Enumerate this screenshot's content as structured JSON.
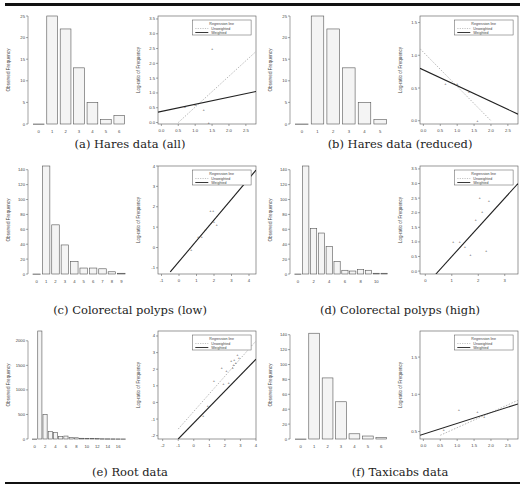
{
  "figure": {
    "subfigures": [
      {
        "id": "a",
        "caption": "(a) Hares data (all)"
      },
      {
        "id": "b",
        "caption": "(b) Hares data (reduced)"
      },
      {
        "id": "c",
        "caption": "(c) Colorectal polyps (low)"
      },
      {
        "id": "d",
        "caption": "(d) Colorectal polyps (high)"
      },
      {
        "id": "e",
        "caption": "(e) Root data"
      },
      {
        "id": "f",
        "caption": "(f) Taxicabs data"
      }
    ]
  },
  "chart_data": [
    {
      "id": "a-bar",
      "type": "bar",
      "ylabel": "Observed Frequency",
      "xlabel": "",
      "categories": [
        "0",
        "1",
        "2",
        "3",
        "4",
        "5",
        "6"
      ],
      "values": [
        0,
        25,
        22,
        13,
        5,
        1,
        2
      ],
      "ylim": [
        0,
        25
      ],
      "yticks": [
        0,
        5,
        10,
        15,
        20,
        25
      ]
    },
    {
      "id": "a-scatter",
      "type": "scatter",
      "ylabel": "Log-ratio of Frequency",
      "xlabel": "",
      "xlim": [
        -0.1,
        2.8
      ],
      "ylim": [
        -0.05,
        3.6
      ],
      "xticks": [
        0.0,
        0.5,
        1.0,
        1.5,
        2.0,
        2.5
      ],
      "yticks": [
        0.0,
        0.5,
        1.0,
        1.5,
        2.0,
        2.5,
        3.0,
        3.5
      ],
      "points": [
        [
          0.7,
          0.55
        ],
        [
          1.0,
          0.6
        ],
        [
          1.25,
          0.45
        ],
        [
          1.4,
          0.0
        ],
        [
          1.5,
          2.5
        ]
      ],
      "lines": {
        "unweighted": [
          [
            0.5,
            0.0
          ],
          [
            2.8,
            2.4
          ]
        ],
        "weighted": [
          [
            -0.1,
            0.35
          ],
          [
            2.8,
            1.05
          ]
        ]
      },
      "legend": {
        "title": "Regression line",
        "entries": [
          "Unweighted",
          "Weighted"
        ]
      }
    },
    {
      "id": "b-bar",
      "type": "bar",
      "ylabel": "Observed Frequency",
      "xlabel": "",
      "categories": [
        "0",
        "1",
        "2",
        "3",
        "4",
        "5"
      ],
      "values": [
        0,
        25,
        22,
        13,
        5,
        1
      ],
      "ylim": [
        0,
        25
      ],
      "yticks": [
        0,
        5,
        10,
        15,
        20,
        25
      ]
    },
    {
      "id": "b-scatter",
      "type": "scatter",
      "ylabel": "Log-ratio of Frequency",
      "xlabel": "",
      "xlim": [
        -0.1,
        2.8
      ],
      "ylim": [
        -0.05,
        1.6
      ],
      "xticks": [
        0.0,
        0.5,
        1.0,
        1.5,
        2.0,
        2.5
      ],
      "yticks": [
        0.0,
        0.5,
        1.0,
        1.5
      ],
      "points": [
        [
          0.65,
          0.57
        ],
        [
          1.0,
          0.57
        ],
        [
          1.35,
          0.44
        ],
        [
          1.6,
          0.0
        ]
      ],
      "lines": {
        "unweighted": [
          [
            -0.1,
            1.1
          ],
          [
            2.0,
            0.0
          ]
        ],
        "weighted": [
          [
            -0.1,
            0.8
          ],
          [
            2.8,
            0.1
          ]
        ]
      },
      "legend": {
        "title": "Regression line",
        "entries": [
          "Unweighted",
          "Weighted"
        ]
      }
    },
    {
      "id": "c-bar",
      "type": "bar",
      "ylabel": "Observed Frequency",
      "xlabel": "",
      "categories": [
        "0",
        "1",
        "2",
        "3",
        "4",
        "5",
        "6",
        "7",
        "8",
        "9"
      ],
      "values": [
        0,
        145,
        66,
        39,
        17,
        8,
        8,
        7,
        3,
        1
      ],
      "ylim": [
        0,
        145
      ],
      "yticks": [
        0,
        20,
        40,
        60,
        80,
        100,
        120,
        140
      ]
    },
    {
      "id": "c-scatter",
      "type": "scatter",
      "ylabel": "Log-ratio of Frequency",
      "xlabel": "",
      "xlim": [
        -1.2,
        4.4
      ],
      "ylim": [
        -1.3,
        4.0
      ],
      "xticks": [
        -1,
        0,
        1,
        2,
        3,
        4
      ],
      "yticks": [
        -1,
        0,
        1,
        2,
        3,
        4
      ],
      "points": [
        [
          0.7,
          -0.1
        ],
        [
          1.1,
          0.55
        ],
        [
          1.3,
          0.55
        ],
        [
          1.5,
          0.85
        ],
        [
          1.8,
          1.8
        ],
        [
          1.95,
          1.8
        ],
        [
          2.0,
          1.25
        ],
        [
          2.15,
          1.1
        ]
      ],
      "lines": {
        "unweighted": [
          [
            -0.5,
            -1.2
          ],
          [
            4.4,
            3.8
          ]
        ],
        "weighted": [
          [
            -0.5,
            -1.2
          ],
          [
            4.4,
            3.8
          ]
        ]
      },
      "legend": {
        "title": "Regression line",
        "entries": [
          "Unweighted",
          "Weighted"
        ]
      }
    },
    {
      "id": "d-bar",
      "type": "bar",
      "ylabel": "Observed Frequency",
      "xlabel": "",
      "categories": [
        "0",
        "1",
        "2",
        "3",
        "4",
        "5",
        "6",
        "7",
        "8",
        "9",
        "10",
        "11"
      ],
      "values": [
        0,
        145,
        61,
        55,
        37,
        17,
        5,
        4,
        6,
        5,
        1,
        1
      ],
      "ylim": [
        0,
        145
      ],
      "yticks": [
        0,
        20,
        40,
        60,
        80,
        100,
        120,
        140
      ],
      "xticks": [
        0,
        2,
        4,
        6,
        8,
        10
      ]
    },
    {
      "id": "d-scatter",
      "type": "scatter",
      "ylabel": "Log-ratio of Frequency",
      "xlabel": "",
      "xlim": [
        -0.2,
        3.5
      ],
      "ylim": [
        -0.1,
        3.6
      ],
      "xticks": [
        0.0,
        1.0,
        2.0,
        3.0
      ],
      "yticks": [
        0.0,
        0.5,
        1.0,
        1.5,
        2.0,
        2.5,
        3.0,
        3.5
      ],
      "points": [
        [
          1.05,
          1.0
        ],
        [
          1.3,
          1.0
        ],
        [
          1.5,
          0.85
        ],
        [
          1.7,
          0.55
        ],
        [
          1.9,
          1.75
        ],
        [
          2.05,
          2.5
        ],
        [
          2.15,
          2.05
        ],
        [
          2.3,
          0.7
        ],
        [
          2.4,
          2.4
        ]
      ],
      "lines": {
        "unweighted": [
          [
            0.4,
            -0.1
          ],
          [
            3.5,
            3.0
          ]
        ],
        "weighted": [
          [
            0.4,
            -0.1
          ],
          [
            3.5,
            3.0
          ]
        ]
      },
      "legend": {
        "title": "Regression line",
        "entries": [
          "Unweighted",
          "Weighted"
        ]
      }
    },
    {
      "id": "e-bar",
      "type": "bar",
      "ylabel": "Observed Frequency",
      "xlabel": "",
      "categories": [
        "0",
        "1",
        "2",
        "3",
        "4",
        "5",
        "6",
        "7",
        "8",
        "9",
        "10",
        "11",
        "12",
        "13",
        "14",
        "15",
        "16",
        "17"
      ],
      "values": [
        0,
        2200,
        500,
        150,
        130,
        50,
        60,
        30,
        25,
        15,
        12,
        10,
        8,
        6,
        5,
        4,
        3,
        2
      ],
      "ylim": [
        0,
        2200
      ],
      "yticks": [
        0,
        500,
        1000,
        1500,
        2000
      ],
      "xticks": [
        0,
        2,
        4,
        6,
        8,
        10,
        12,
        14,
        16
      ]
    },
    {
      "id": "e-scatter",
      "type": "scatter",
      "ylabel": "Log-ratio of Frequency",
      "xlabel": "",
      "xlim": [
        -2.3,
        4.0
      ],
      "ylim": [
        -2.2,
        4.3
      ],
      "xticks": [
        -2,
        -1,
        0,
        1,
        2,
        3,
        4
      ],
      "yticks": [
        -2,
        -1,
        0,
        1,
        2,
        3,
        4
      ],
      "points": [
        [
          0.6,
          -0.8
        ],
        [
          0.9,
          -0.2
        ],
        [
          1.3,
          1.3
        ],
        [
          1.8,
          2.1
        ],
        [
          1.9,
          1.1
        ],
        [
          2.1,
          1.9
        ],
        [
          2.25,
          1.2
        ],
        [
          2.4,
          2.5
        ],
        [
          2.5,
          2.1
        ],
        [
          2.55,
          2.3
        ],
        [
          2.6,
          2.6
        ],
        [
          2.7,
          2.4
        ],
        [
          2.8,
          2.9
        ],
        [
          2.9,
          2.7
        ]
      ],
      "lines": {
        "unweighted": [
          [
            -1.0,
            -1.6
          ],
          [
            4.0,
            3.7
          ]
        ],
        "weighted": [
          [
            -1.0,
            -2.2
          ],
          [
            4.0,
            2.6
          ]
        ]
      },
      "legend": {
        "title": "Regression line",
        "entries": [
          "Unweighted",
          "Weighted"
        ]
      }
    },
    {
      "id": "f-bar",
      "type": "bar",
      "ylabel": "Observed Frequency",
      "xlabel": "",
      "categories": [
        "0",
        "1",
        "2",
        "3",
        "4",
        "5",
        "6"
      ],
      "values": [
        0,
        142,
        82,
        50,
        7,
        4,
        2
      ],
      "ylim": [
        0,
        145
      ],
      "yticks": [
        0,
        20,
        40,
        60,
        80,
        100,
        120,
        140
      ]
    },
    {
      "id": "f-scatter",
      "type": "scatter",
      "ylabel": "Log-ratio of Frequency",
      "xlabel": "",
      "xlim": [
        -0.1,
        2.8
      ],
      "ylim": [
        0.4,
        1.85
      ],
      "xticks": [
        0.0,
        0.5,
        1.0,
        1.5,
        2.0,
        2.5
      ],
      "yticks": [
        0.5,
        1.0,
        1.5
      ],
      "points": [
        [
          0.6,
          0.53
        ],
        [
          1.05,
          0.8
        ],
        [
          1.6,
          0.77
        ],
        [
          1.8,
          0.7
        ]
      ],
      "lines": {
        "unweighted": [
          [
            0.5,
            0.45
          ],
          [
            2.8,
            0.92
          ]
        ],
        "weighted": [
          [
            -0.1,
            0.45
          ],
          [
            2.8,
            0.87
          ]
        ]
      },
      "legend": {
        "title": "Regression line",
        "entries": [
          "Unweighted",
          "Weighted"
        ]
      }
    }
  ]
}
